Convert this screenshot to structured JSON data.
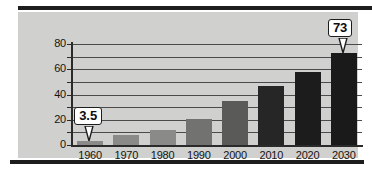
{
  "chart_data": {
    "type": "bar",
    "title": "",
    "subtitle": "",
    "xlabel": "",
    "ylabel": "",
    "categories": [
      "1960",
      "1970",
      "1980",
      "1990",
      "2000",
      "2010",
      "2020",
      "2030"
    ],
    "values": [
      3.5,
      8,
      12,
      21,
      35,
      47,
      58,
      73
    ],
    "series": [
      {
        "name": "",
        "values": [
          3.5,
          8,
          12,
          21,
          35,
          47,
          58,
          73
        ]
      }
    ],
    "ylim": [
      0,
      80
    ],
    "xlim": [
      0,
      8
    ],
    "y_ticks": [
      0,
      20,
      40,
      60,
      80
    ],
    "y_tick_labels": [
      "0",
      "20",
      "40",
      "60",
      "80"
    ],
    "gridlines": [
      10,
      20,
      30,
      40,
      50,
      60,
      70,
      80
    ],
    "grid": true,
    "grid_axis": "y",
    "legend": false,
    "legend_position": "none",
    "annotations": [
      {
        "label": "3.5",
        "category": "1960",
        "value": 3.5
      },
      {
        "label": "73",
        "category": "2030",
        "value": 73
      }
    ],
    "bar_colors": [
      "#8a8a88",
      "#8a8a88",
      "#8a8a88",
      "#727270",
      "#5a5a58",
      "#262626",
      "#1c1c1c",
      "#1a1a1a"
    ],
    "plot_background": "#d0d0ce",
    "gridline_color": "#4a4a4a",
    "axis_color": "#2a2a2a",
    "text_color": "#141414",
    "callout_background": "#ffffff",
    "callout_border": "#1d1d1d"
  },
  "axis": {
    "y_labels": [
      "80",
      "60",
      "40",
      "20",
      "0"
    ],
    "x_labels": [
      "1960",
      "1970",
      "1980",
      "1990",
      "2000",
      "2010",
      "2020",
      "2030"
    ]
  },
  "callouts": {
    "first": "3.5",
    "last": "73"
  }
}
